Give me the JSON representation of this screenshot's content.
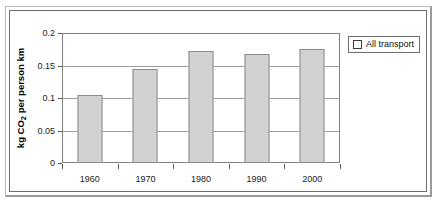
{
  "chart_data": {
    "type": "bar",
    "title": "",
    "xlabel": "",
    "ylabel": "kg CO2 per person km",
    "ylabel_prefix": "kg CO",
    "ylabel_sub": "2",
    "ylabel_suffix": " per person km",
    "categories": [
      "1960",
      "1970",
      "1980",
      "1990",
      "2000"
    ],
    "series": [
      {
        "name": "All transport",
        "values": [
          0.105,
          0.145,
          0.173,
          0.167,
          0.175
        ]
      }
    ],
    "ylim": [
      0,
      0.2
    ],
    "ytick_values": [
      "0",
      "0.05",
      "0.1",
      "0.15",
      "0.2"
    ],
    "grid": "horizontal",
    "legend_position": "right-outside",
    "colors": {
      "bar_fill": "#d2d2d2",
      "bar_border": "#8c8c8c",
      "gridline": "#9d9d9d",
      "axis": "#808080",
      "text": "#1b1b1b",
      "frame": "#6e6e6e"
    }
  },
  "legend": {
    "entries": [
      {
        "label": "All transport",
        "marker": "hollow-square"
      }
    ]
  }
}
